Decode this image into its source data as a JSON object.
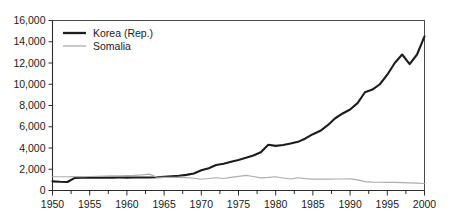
{
  "chart_data": {
    "type": "line",
    "title": "",
    "xlabel": "",
    "ylabel": "",
    "xlim": [
      1950,
      2000
    ],
    "ylim": [
      0,
      16000
    ],
    "grid": false,
    "legend_position": "top-left",
    "y_ticks": [
      0,
      2000,
      4000,
      6000,
      8000,
      10000,
      12000,
      14000,
      16000
    ],
    "y_tick_labels": [
      "0",
      "2,000",
      "4,000",
      "6,000",
      "8,000",
      "10,000",
      "12,000",
      "14,000",
      "16,000"
    ],
    "x_ticks": [
      1950,
      1955,
      1960,
      1965,
      1970,
      1975,
      1980,
      1985,
      1990,
      1995,
      2000
    ],
    "x_tick_labels": [
      "1950",
      "1955",
      "1960",
      "1965",
      "1970",
      "1975",
      "1980",
      "1985",
      "1990",
      "1995",
      "2000"
    ],
    "x_minor_tick_interval": 2.5,
    "series": [
      {
        "name": "Korea (Rep.)",
        "color": "#1c1c1c",
        "width": 2.1,
        "x": [
          1950,
          1951,
          1952,
          1953,
          1954,
          1955,
          1956,
          1957,
          1958,
          1959,
          1960,
          1961,
          1962,
          1963,
          1964,
          1965,
          1966,
          1967,
          1968,
          1969,
          1970,
          1971,
          1972,
          1973,
          1974,
          1975,
          1976,
          1977,
          1978,
          1979,
          1980,
          1981,
          1982,
          1983,
          1984,
          1985,
          1986,
          1987,
          1988,
          1989,
          1990,
          1991,
          1992,
          1993,
          1994,
          1995,
          1996,
          1997,
          1998,
          1999,
          2000
        ],
        "values": [
          860,
          820,
          800,
          1190,
          1200,
          1205,
          1200,
          1210,
          1215,
          1220,
          1215,
          1220,
          1225,
          1230,
          1240,
          1280,
          1330,
          1390,
          1470,
          1600,
          1900,
          2100,
          2400,
          2520,
          2700,
          2880,
          3080,
          3300,
          3600,
          4300,
          4200,
          4280,
          4420,
          4580,
          4900,
          5300,
          5620,
          6150,
          6800,
          7250,
          7620,
          8220,
          9250,
          9500,
          10000,
          10900,
          12000,
          12800,
          11900,
          12800,
          14500
        ]
      },
      {
        "name": "Somalia",
        "color": "#adadad",
        "width": 1.15,
        "x": [
          1950,
          1951,
          1952,
          1953,
          1954,
          1955,
          1956,
          1957,
          1958,
          1959,
          1960,
          1961,
          1962,
          1963,
          1964,
          1965,
          1966,
          1967,
          1968,
          1969,
          1970,
          1971,
          1972,
          1973,
          1974,
          1975,
          1976,
          1977,
          1978,
          1979,
          1980,
          1981,
          1982,
          1983,
          1984,
          1985,
          1986,
          1987,
          1988,
          1989,
          1990,
          1991,
          1992,
          1993,
          1994,
          1995,
          1996,
          1997,
          1998,
          1999,
          2000
        ],
        "values": [
          1290,
          1290,
          1295,
          1300,
          1310,
          1320,
          1330,
          1350,
          1370,
          1390,
          1410,
          1430,
          1470,
          1540,
          1260,
          1230,
          1230,
          1230,
          1210,
          1150,
          1060,
          1130,
          1200,
          1130,
          1230,
          1330,
          1420,
          1320,
          1190,
          1230,
          1290,
          1180,
          1080,
          1200,
          1120,
          1070,
          1080,
          1070,
          1080,
          1080,
          1090,
          1000,
          830,
          790,
          780,
          770,
          760,
          740,
          720,
          690,
          660
        ]
      }
    ]
  },
  "legend": {
    "items": [
      {
        "label": "Korea (Rep.)",
        "style": "thick-dark"
      },
      {
        "label": "Somalia",
        "style": "thin-gray"
      }
    ]
  }
}
